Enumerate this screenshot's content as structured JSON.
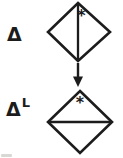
{
  "figure": {
    "background_color": "#ffffff",
    "ink_color": "#1c1c1c",
    "top": {
      "label": "Δ",
      "diamond_marker": "*",
      "diamond_divider": "vertical"
    },
    "arrow_direction": "down",
    "bottom": {
      "label_base": "Δ",
      "label_superscript": "L",
      "diamond_marker": "*",
      "diamond_divider": "horizontal"
    }
  }
}
